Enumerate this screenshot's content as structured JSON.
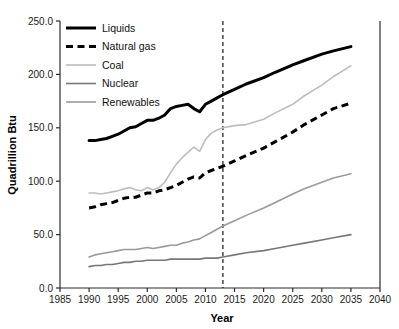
{
  "chart_data": {
    "type": "line",
    "title": "",
    "xlabel": "Year",
    "ylabel": "Quadrillion Btu",
    "xlim": [
      1985,
      2040
    ],
    "ylim": [
      0.0,
      250.0
    ],
    "xticks": [
      1985,
      1990,
      1995,
      2000,
      2005,
      2010,
      2015,
      2020,
      2025,
      2030,
      2035,
      2040
    ],
    "xtick_labels": [
      "1985",
      "1990",
      "1995",
      "2000",
      "2005",
      "2010",
      "2015",
      "2020",
      "2025",
      "2030",
      "2035",
      "2040"
    ],
    "yticks": [
      0.0,
      50.0,
      100.0,
      150.0,
      200.0,
      250.0
    ],
    "ytick_labels": [
      "0.0",
      "50.0",
      "100.0",
      "150.0",
      "200.0",
      "250.0"
    ],
    "grid": false,
    "legend_position": "upper left",
    "annotations": [
      {
        "name": "history-projection-divider",
        "type": "vline",
        "x": 2013,
        "style": "dashed",
        "color": "#000000",
        "label": ""
      }
    ],
    "x": [
      1990,
      1991,
      1992,
      1993,
      1994,
      1995,
      1996,
      1997,
      1998,
      1999,
      2000,
      2001,
      2002,
      2003,
      2004,
      2005,
      2006,
      2007,
      2008,
      2009,
      2010,
      2011,
      2012,
      2013,
      2015,
      2017,
      2020,
      2022,
      2025,
      2027,
      2030,
      2032,
      2035
    ],
    "series": [
      {
        "name": "Liquids",
        "color": "#000000",
        "width": 3.0,
        "dash": "solid",
        "values": [
          138,
          138,
          139,
          140,
          142,
          144,
          147,
          150,
          151,
          154,
          157,
          157,
          159,
          162,
          168,
          170,
          171,
          172,
          168,
          165,
          172,
          175,
          178,
          181,
          186,
          191,
          197,
          202,
          209,
          213,
          219,
          222,
          226
        ]
      },
      {
        "name": "Natural gas",
        "color": "#000000",
        "width": 3.0,
        "dash": "dashed",
        "values": [
          75,
          76,
          78,
          79,
          80,
          82,
          84,
          85,
          85,
          87,
          89,
          89,
          91,
          92,
          94,
          96,
          99,
          102,
          104,
          103,
          108,
          110,
          112,
          114,
          119,
          124,
          131,
          137,
          146,
          153,
          162,
          168,
          173
        ]
      },
      {
        "name": "Coal",
        "color": "#bdbdbd",
        "width": 1.6,
        "dash": "solid",
        "values": [
          89,
          89,
          88,
          89,
          90,
          91,
          93,
          94,
          92,
          91,
          94,
          92,
          94,
          99,
          108,
          116,
          122,
          127,
          132,
          128,
          139,
          145,
          148,
          150,
          152,
          153,
          158,
          164,
          172,
          180,
          190,
          198,
          208
        ]
      },
      {
        "name": "Nuclear",
        "color": "#777777",
        "width": 1.6,
        "dash": "solid",
        "values": [
          20,
          21,
          21,
          22,
          22,
          23,
          24,
          24,
          25,
          25,
          26,
          26,
          26,
          26,
          27,
          27,
          27,
          27,
          27,
          27,
          28,
          28,
          28,
          29,
          31,
          33,
          35,
          37,
          40,
          42,
          45,
          47,
          50
        ]
      },
      {
        "name": "Renewables",
        "color": "#9a9a9a",
        "width": 1.6,
        "dash": "solid",
        "values": [
          29,
          31,
          32,
          33,
          34,
          35,
          36,
          36,
          36,
          37,
          38,
          37,
          38,
          39,
          40,
          40,
          42,
          43,
          45,
          46,
          49,
          52,
          55,
          58,
          63,
          68,
          75,
          80,
          88,
          93,
          99,
          103,
          107
        ]
      }
    ]
  },
  "legend": {
    "items": [
      {
        "label": "Liquids"
      },
      {
        "label": "Natural gas"
      },
      {
        "label": "Coal"
      },
      {
        "label": "Nuclear"
      },
      {
        "label": "Renewables"
      }
    ]
  }
}
